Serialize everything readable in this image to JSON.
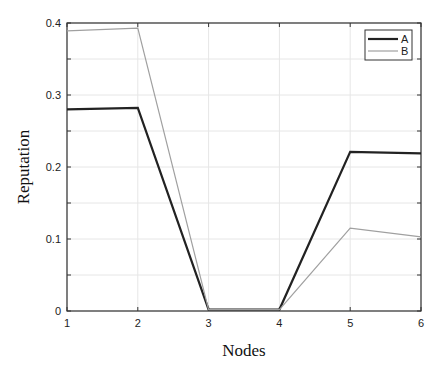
{
  "chart_data": {
    "type": "line",
    "title": "",
    "xlabel": "Nodes",
    "ylabel": "Reputation",
    "x": [
      1,
      2,
      3,
      4,
      5,
      6
    ],
    "xticks": [
      "1",
      "2",
      "3",
      "4",
      "5",
      "6"
    ],
    "yticks": [
      "0",
      "0.1",
      "0.2",
      "0.3",
      "0.4"
    ],
    "xlim": [
      1,
      6
    ],
    "ylim": [
      0,
      0.4
    ],
    "grid": true,
    "legend_position": "upper right",
    "series": [
      {
        "name": "A",
        "color": "#222222",
        "values": [
          0.28,
          0.282,
          0.002,
          0.002,
          0.221,
          0.219
        ]
      },
      {
        "name": "B",
        "color": "#a0a0a0",
        "values": [
          0.389,
          0.393,
          0.002,
          0.002,
          0.115,
          0.103
        ]
      }
    ]
  }
}
